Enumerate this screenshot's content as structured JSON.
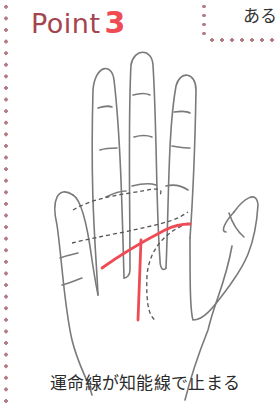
{
  "header": {
    "title_word": "Point",
    "title_number": "3",
    "callout_text": "ある"
  },
  "illustration": {
    "subject": "palm-of-hand",
    "highlight_color": "#ef4b55",
    "outline_color": "#7a7a7a",
    "highlighted_lines": [
      "fate-line",
      "head-line"
    ],
    "dashed_lines": [
      "heart-line",
      "life-line"
    ]
  },
  "caption": {
    "text": "運命線が知能線で止まる"
  },
  "colors": {
    "title_word": "#a4454e",
    "title_number": "#ef4b55",
    "dots": "#b47d86",
    "text": "#2b2b2b"
  }
}
